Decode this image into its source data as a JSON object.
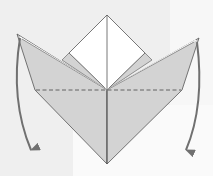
{
  "diagram": {
    "type": "origami-fold-step",
    "colors": {
      "background": "#efefef",
      "paper_colored": "#d3d3d3",
      "paper_white": "#ffffff",
      "outline": "#555555",
      "arrow": "#707070",
      "valley_fold_line": "#555555"
    },
    "annotations": {
      "left_arrow": "fold down left flap",
      "right_arrow": "fold down right flap",
      "fold_line": "valley fold (dashed)"
    }
  }
}
